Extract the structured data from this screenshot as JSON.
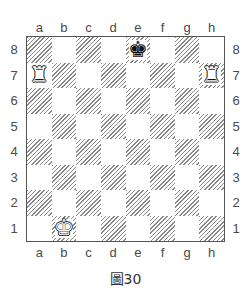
{
  "diagram": {
    "caption": "圖30",
    "files": [
      "a",
      "b",
      "c",
      "d",
      "e",
      "f",
      "g",
      "h"
    ],
    "ranks": [
      "8",
      "7",
      "6",
      "5",
      "4",
      "3",
      "2",
      "1"
    ],
    "colors": {
      "light_square": "#ffffff",
      "dark_square_hatch": "#8a8a8a",
      "border": "#555555"
    },
    "pieces": [
      {
        "square": "e8",
        "color": "black",
        "type": "king",
        "glyph": "♚"
      },
      {
        "square": "a7",
        "color": "white",
        "type": "rook",
        "glyph": "♜"
      },
      {
        "square": "h7",
        "color": "white",
        "type": "rook",
        "glyph": "♜"
      },
      {
        "square": "b1",
        "color": "white",
        "type": "king",
        "glyph": "♚"
      }
    ]
  }
}
